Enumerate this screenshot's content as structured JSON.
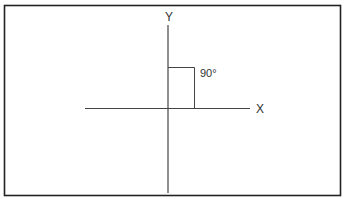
{
  "diagram": {
    "axes": {
      "y_label": "Y",
      "x_label": "X"
    },
    "angle": {
      "label": "90°",
      "degrees": 90
    },
    "colors": {
      "line": "#444444",
      "border": "#222222",
      "text": "#333333",
      "background": "#ffffff"
    }
  }
}
